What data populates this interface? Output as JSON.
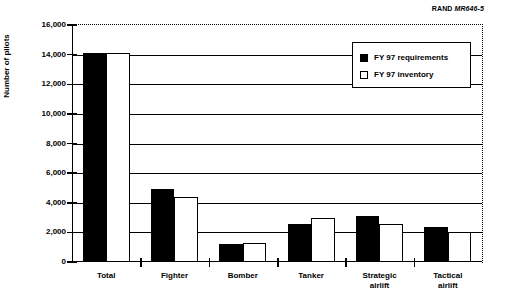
{
  "figure": {
    "source_credit_prefix": "RAND",
    "source_credit_id": "MR646-5"
  },
  "chart_data": {
    "type": "bar",
    "title": "",
    "xlabel": "",
    "ylabel": "Number of pilots",
    "ylim": [
      0,
      16000
    ],
    "ytick_labels": [
      "16,000",
      "14,000",
      "12,000",
      "10,000",
      "8,000",
      "6,000",
      "4,000",
      "2,000",
      "0"
    ],
    "ytick_values": [
      16000,
      14000,
      12000,
      10000,
      8000,
      6000,
      4000,
      2000,
      0
    ],
    "grid": true,
    "legend_position": "upper right",
    "categories": [
      "Total",
      "Fighter",
      "Bomber",
      "Tanker",
      "Strategic airlift",
      "Tactical airlift"
    ],
    "category_lines": [
      [
        "Total"
      ],
      [
        "Fighter"
      ],
      [
        "Bomber"
      ],
      [
        "Tanker"
      ],
      [
        "Strategic",
        "airlift"
      ],
      [
        "Tactical",
        "airlift"
      ]
    ],
    "series": [
      {
        "name": "FY 97 requirements",
        "style": "filled-black",
        "color": "#000000",
        "values": [
          14100,
          4900,
          1200,
          2600,
          3100,
          2350
        ]
      },
      {
        "name": "FY 97 inventory",
        "style": "open-white",
        "color": "#ffffff",
        "values": [
          14100,
          4400,
          1300,
          3000,
          2600,
          2050
        ]
      }
    ]
  }
}
